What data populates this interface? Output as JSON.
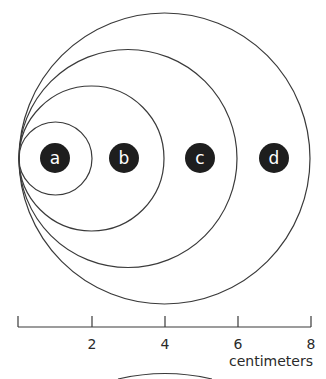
{
  "diagram": {
    "type": "nested tangent circles with scale",
    "circles": [
      {
        "label": "a",
        "diameter_cm": 2
      },
      {
        "label": "b",
        "diameter_cm": 4
      },
      {
        "label": "c",
        "diameter_cm": 6
      },
      {
        "label": "d",
        "diameter_cm": 8
      }
    ],
    "scale": {
      "ticks": [
        "",
        "2",
        "4",
        "6",
        "8"
      ],
      "unit": "centimeters"
    },
    "colors": {
      "stroke": "#3a3a3a",
      "badge": "#1e1e1e",
      "badge_text": "#ffffff"
    }
  }
}
